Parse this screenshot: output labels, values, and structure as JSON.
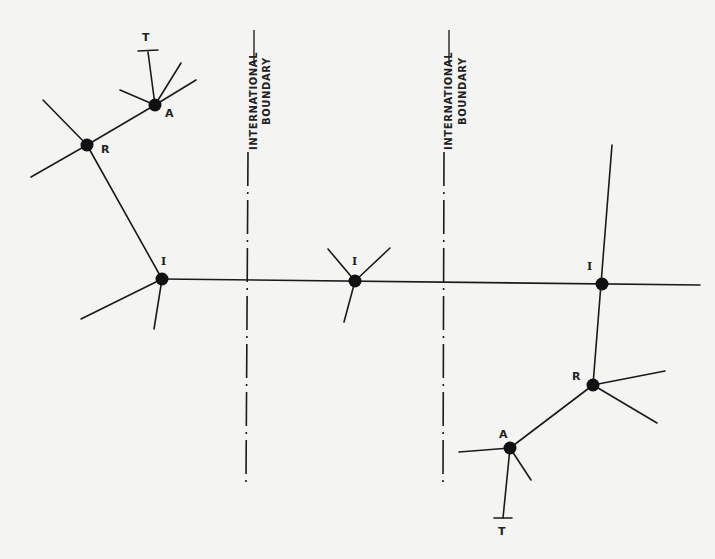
{
  "diagram": {
    "type": "network-hierarchy",
    "boundaries": [
      {
        "id": "boundary-1",
        "label_line1": "INTERNATIONAL",
        "label_line2": "BOUNDARY",
        "x": 248
      },
      {
        "id": "boundary-2",
        "label_line1": "INTERNATIONAL",
        "label_line2": "BOUNDARY",
        "x": 444
      }
    ],
    "nodes": [
      {
        "id": "left-T",
        "label": "T",
        "x": 148,
        "y": 52
      },
      {
        "id": "left-A",
        "label": "A",
        "x": 155,
        "y": 105
      },
      {
        "id": "left-R",
        "label": "R",
        "x": 87,
        "y": 145
      },
      {
        "id": "left-I",
        "label": "I",
        "x": 162,
        "y": 279
      },
      {
        "id": "mid-I",
        "label": "I",
        "x": 355,
        "y": 281
      },
      {
        "id": "right-I",
        "label": "I",
        "x": 602,
        "y": 284
      },
      {
        "id": "right-R",
        "label": "R",
        "x": 593,
        "y": 385
      },
      {
        "id": "right-A",
        "label": "A",
        "x": 510,
        "y": 448
      },
      {
        "id": "right-T",
        "label": "T",
        "x": 503,
        "y": 517
      }
    ],
    "edges": [
      [
        "left-T",
        "left-A"
      ],
      [
        "left-A",
        "left-R"
      ],
      [
        "left-R",
        "left-I"
      ],
      [
        "left-I",
        "mid-I"
      ],
      [
        "mid-I",
        "right-I"
      ],
      [
        "right-I",
        "right-R"
      ],
      [
        "right-R",
        "right-A"
      ],
      [
        "right-A",
        "right-T"
      ]
    ]
  }
}
